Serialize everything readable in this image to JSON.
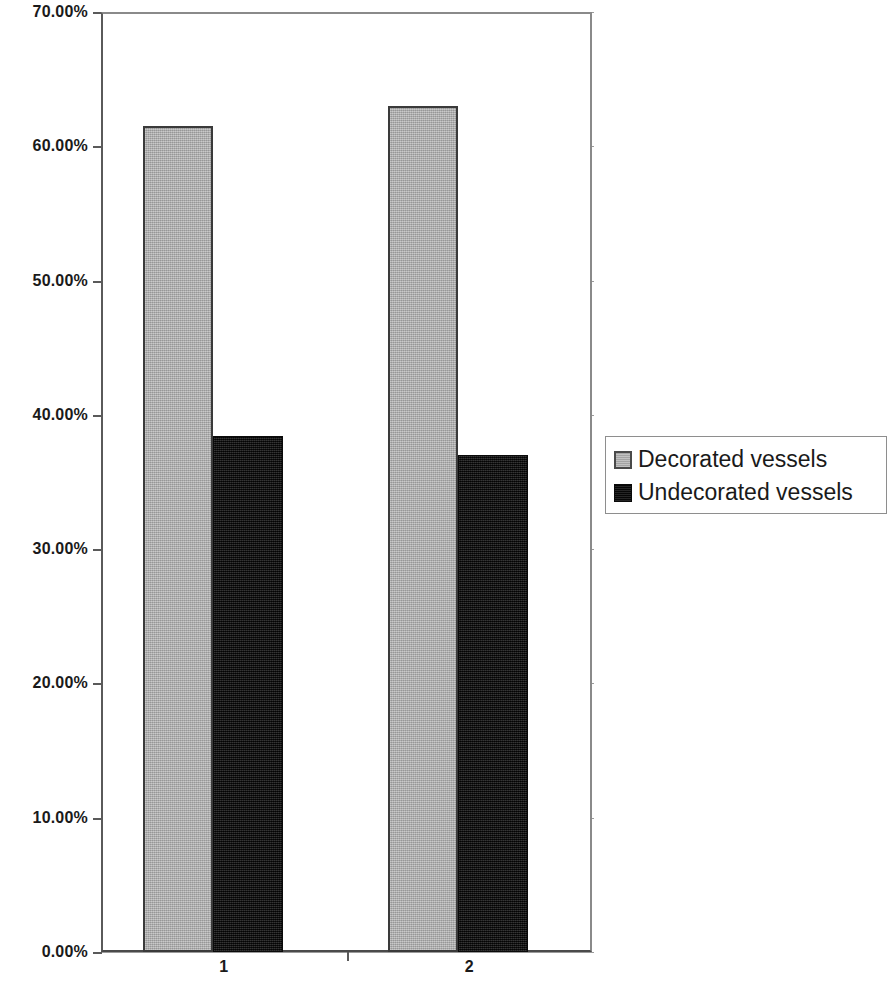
{
  "chart_data": {
    "type": "bar",
    "title": "",
    "subtitle": "",
    "xlabel": "",
    "ylabel": "",
    "categories": [
      "1",
      "2"
    ],
    "series": [
      {
        "name": "Decorated vessels",
        "color": "#b6b6b6",
        "values": [
          61.5,
          63.0
        ]
      },
      {
        "name": "Undecorated vessels",
        "color": "#0d0d0d",
        "values": [
          38.4,
          37.0
        ]
      }
    ],
    "ylim": [
      0,
      70
    ],
    "ytick_values": [
      0,
      10,
      20,
      30,
      40,
      50,
      60,
      70
    ],
    "ytick_labels": [
      "0.00%",
      "10.00%",
      "20.00%",
      "30.00%",
      "40.00%",
      "50.00%",
      "60.00%",
      "70.00%"
    ],
    "value_format": "percent",
    "grid": true,
    "grid_axis": "y",
    "legend": true,
    "legend_position": "right",
    "legend_entries": [
      "Decorated vessels",
      "Undecorated vessels"
    ],
    "bar_group_gap": true,
    "axis_color": "#5a5a5a",
    "grid_color": "#9a9a9a",
    "background": "#ffffff"
  },
  "axis": {
    "y_labels": [
      "70.00%",
      "60.00%",
      "50.00%",
      "40.00%",
      "30.00%",
      "20.00%",
      "10.00%",
      "0.00%"
    ],
    "x_labels": [
      "1",
      "2"
    ]
  },
  "legend": {
    "items": [
      {
        "label": "Decorated vessels",
        "swatch": "light-gray-square"
      },
      {
        "label": "Undecorated vessels",
        "swatch": "black-square"
      }
    ]
  }
}
